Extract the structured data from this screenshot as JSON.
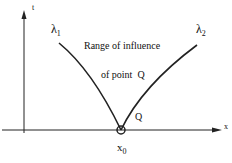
{
  "diagram": {
    "axis_labels": {
      "t": "t",
      "x": "x"
    },
    "characteristics": {
      "left": "λ",
      "left_sub": "1",
      "right": "λ",
      "right_sub": "2"
    },
    "caption_line1": "Range of influence",
    "caption_line2": "of point  Q",
    "point_label": "Q",
    "origin_label": "x",
    "origin_sub": "0"
  }
}
